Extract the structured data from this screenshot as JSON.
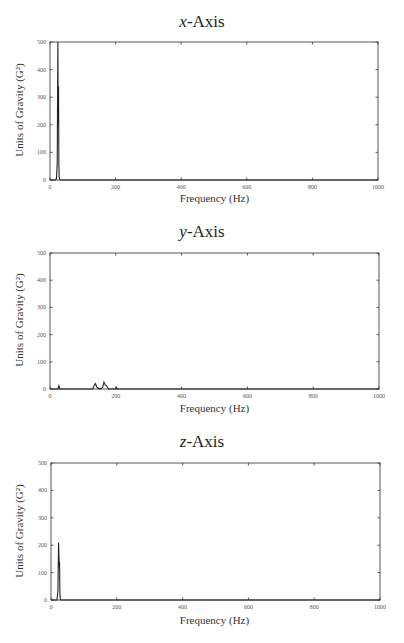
{
  "figure": {
    "panels": [
      {
        "title_var": "x",
        "title_rest": "-Axis"
      },
      {
        "title_var": "y",
        "title_rest": "-Axis"
      },
      {
        "title_var": "z",
        "title_rest": "-Axis"
      }
    ],
    "ylabel": "Units of Gravity (G²)",
    "xlabel": "Frequency (Hz)",
    "line_color": "#222222"
  },
  "chart_data": [
    {
      "type": "line",
      "title": "x-Axis",
      "xlabel": "Frequency (Hz)",
      "ylabel": "Units of Gravity (G²)",
      "xlim": [
        0,
        1000
      ],
      "ylim": [
        0,
        500
      ],
      "xticks": [
        0,
        200,
        400,
        600,
        800,
        1000
      ],
      "yticks": [
        0,
        100,
        200,
        300,
        400,
        500
      ],
      "grid": false,
      "series": [
        {
          "name": "x-Axis PSD",
          "x": [
            0,
            18,
            20,
            22,
            24,
            25,
            26,
            27,
            28,
            30,
            32,
            1000
          ],
          "y": [
            0,
            0,
            10,
            60,
            500,
            200,
            340,
            60,
            10,
            2,
            0,
            0
          ]
        }
      ]
    },
    {
      "type": "line",
      "title": "y-Axis",
      "xlabel": "Frequency (Hz)",
      "ylabel": "Units of Gravity (G²)",
      "xlim": [
        0,
        1000
      ],
      "ylim": [
        0,
        500
      ],
      "xticks": [
        0,
        200,
        400,
        600,
        800,
        1000
      ],
      "yticks": [
        0,
        100,
        200,
        300,
        400,
        500
      ],
      "grid": false,
      "series": [
        {
          "name": "y-Axis PSD",
          "x": [
            0,
            24,
            27,
            30,
            130,
            135,
            138,
            142,
            150,
            160,
            164,
            168,
            172,
            178,
            200,
            202,
            205,
            1000
          ],
          "y": [
            0,
            0,
            12,
            0,
            0,
            15,
            20,
            8,
            0,
            5,
            25,
            15,
            12,
            0,
            0,
            6,
            0,
            0
          ]
        }
      ]
    },
    {
      "type": "line",
      "title": "z-Axis",
      "xlabel": "Frequency (Hz)",
      "ylabel": "Units of Gravity (G²)",
      "xlim": [
        0,
        1000
      ],
      "ylim": [
        0,
        500
      ],
      "xticks": [
        0,
        200,
        400,
        600,
        800,
        1000
      ],
      "yticks": [
        0,
        100,
        200,
        300,
        400,
        500
      ],
      "grid": false,
      "series": [
        {
          "name": "z-Axis PSD",
          "x": [
            0,
            18,
            21,
            23,
            25,
            26,
            27,
            28,
            30,
            1000
          ],
          "y": [
            0,
            0,
            30,
            210,
            120,
            140,
            30,
            5,
            0,
            0
          ]
        }
      ]
    }
  ]
}
